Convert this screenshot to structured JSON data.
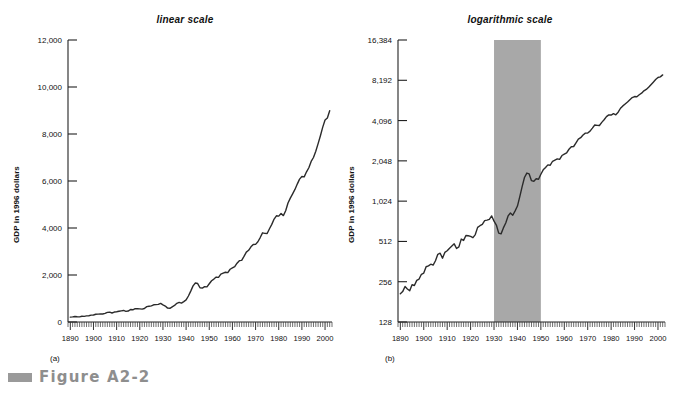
{
  "figure": {
    "caption": "Figure A2-2",
    "swatch_color": "#9a9a9a",
    "caption_color": "#8e8e8e"
  },
  "panels": [
    {
      "id": "linear",
      "title": "linear scale",
      "sub_label": "(a)",
      "y_axis_title": "GDP in 1996 dollars"
    },
    {
      "id": "log",
      "title": "logarithmic scale",
      "sub_label": "(b)",
      "y_axis_title": "GDP in 1996 dollars"
    }
  ],
  "chart_data": [
    {
      "type": "line",
      "id": "linear",
      "title": "linear scale",
      "xlabel": "",
      "ylabel": "GDP in 1996 dollars",
      "yscale": "linear",
      "ylim": [
        0,
        12000
      ],
      "xlim": [
        1889,
        2003
      ],
      "yticks": [
        0,
        2000,
        4000,
        6000,
        8000,
        10000,
        12000
      ],
      "ytick_labels": [
        "0",
        "2,000",
        "4,000",
        "6,000",
        "8,000",
        "10,000",
        "12,000"
      ],
      "xticks": [
        1890,
        1900,
        1910,
        1920,
        1930,
        1940,
        1950,
        1960,
        1970,
        1980,
        1990,
        2000
      ],
      "xtick_labels": [
        "1890",
        "1900",
        "1910",
        "1920",
        "1930",
        "1940",
        "1950",
        "1960",
        "1970",
        "1980",
        "1990",
        "2000"
      ],
      "minor_xtick_interval": 1,
      "grid": false,
      "legend": "none",
      "line_color": "#2b2b2b",
      "x": [
        1890,
        1891,
        1892,
        1893,
        1894,
        1895,
        1896,
        1897,
        1898,
        1899,
        1900,
        1901,
        1902,
        1903,
        1904,
        1905,
        1906,
        1907,
        1908,
        1909,
        1910,
        1911,
        1912,
        1913,
        1914,
        1915,
        1916,
        1917,
        1918,
        1919,
        1920,
        1921,
        1922,
        1923,
        1924,
        1925,
        1926,
        1927,
        1928,
        1929,
        1930,
        1931,
        1932,
        1933,
        1934,
        1935,
        1936,
        1937,
        1938,
        1939,
        1940,
        1941,
        1942,
        1943,
        1944,
        1945,
        1946,
        1947,
        1948,
        1949,
        1950,
        1951,
        1952,
        1953,
        1954,
        1955,
        1956,
        1957,
        1958,
        1959,
        1960,
        1961,
        1962,
        1963,
        1964,
        1965,
        1966,
        1967,
        1968,
        1969,
        1970,
        1971,
        1972,
        1973,
        1974,
        1975,
        1976,
        1977,
        1978,
        1979,
        1980,
        1981,
        1982,
        1983,
        1984,
        1985,
        1986,
        1987,
        1988,
        1989,
        1990,
        1991,
        1992,
        1993,
        1994,
        1995,
        1996,
        1997,
        1998,
        1999,
        2000,
        2001,
        2002
      ],
      "y": [
        208,
        216,
        236,
        226,
        219,
        243,
        240,
        262,
        268,
        291,
        297,
        331,
        336,
        346,
        341,
        367,
        410,
        418,
        384,
        424,
        436,
        456,
        473,
        491,
        453,
        466,
        533,
        521,
        567,
        565,
        559,
        546,
        576,
        652,
        671,
        687,
        732,
        739,
        748,
        794,
        726,
        679,
        591,
        583,
        646,
        703,
        794,
        835,
        803,
        867,
        941,
        1107,
        1314,
        1538,
        1660,
        1636,
        1456,
        1443,
        1504,
        1494,
        1626,
        1755,
        1827,
        1912,
        1900,
        2034,
        2076,
        2117,
        2100,
        2245,
        2301,
        2353,
        2501,
        2610,
        2622,
        2791,
        2974,
        3050,
        3199,
        3300,
        3304,
        3414,
        3593,
        3795,
        3772,
        3765,
        3969,
        4153,
        4381,
        4519,
        4506,
        4618,
        4527,
        4732,
        5064,
        5273,
        5455,
        5642,
        5869,
        6081,
        6192,
        6177,
        6391,
        6565,
        6834,
        7000,
        7266,
        7592,
        7928,
        8291,
        8597,
        8684,
        8990
      ]
    },
    {
      "type": "line",
      "id": "log",
      "title": "logarithmic scale",
      "xlabel": "",
      "ylabel": "GDP in 1996 dollars",
      "yscale": "log2",
      "ylim": [
        128,
        16384
      ],
      "xlim": [
        1889,
        2003
      ],
      "yticks": [
        128,
        256,
        512,
        1024,
        2048,
        4096,
        8192,
        16384
      ],
      "ytick_labels": [
        "128",
        "256",
        "512",
        "1,024",
        "2,048",
        "4,096",
        "8,192",
        "16,384"
      ],
      "xticks": [
        1890,
        1900,
        1910,
        1920,
        1930,
        1940,
        1950,
        1960,
        1970,
        1980,
        1990,
        2000
      ],
      "xtick_labels": [
        "1890",
        "1900",
        "1910",
        "1920",
        "1930",
        "1940",
        "1950",
        "1960",
        "1970",
        "1980",
        "1990",
        "2000"
      ],
      "minor_xtick_interval": 1,
      "grid": false,
      "legend": "none",
      "line_color": "#2b2b2b",
      "shaded_region": {
        "x_start": 1930,
        "x_end": 1950,
        "color": "#a8a8a8",
        "label": "Great Depression and World War II"
      },
      "x": [
        1890,
        1891,
        1892,
        1893,
        1894,
        1895,
        1896,
        1897,
        1898,
        1899,
        1900,
        1901,
        1902,
        1903,
        1904,
        1905,
        1906,
        1907,
        1908,
        1909,
        1910,
        1911,
        1912,
        1913,
        1914,
        1915,
        1916,
        1917,
        1918,
        1919,
        1920,
        1921,
        1922,
        1923,
        1924,
        1925,
        1926,
        1927,
        1928,
        1929,
        1930,
        1931,
        1932,
        1933,
        1934,
        1935,
        1936,
        1937,
        1938,
        1939,
        1940,
        1941,
        1942,
        1943,
        1944,
        1945,
        1946,
        1947,
        1948,
        1949,
        1950,
        1951,
        1952,
        1953,
        1954,
        1955,
        1956,
        1957,
        1958,
        1959,
        1960,
        1961,
        1962,
        1963,
        1964,
        1965,
        1966,
        1967,
        1968,
        1969,
        1970,
        1971,
        1972,
        1973,
        1974,
        1975,
        1976,
        1977,
        1978,
        1979,
        1980,
        1981,
        1982,
        1983,
        1984,
        1985,
        1986,
        1987,
        1988,
        1989,
        1990,
        1991,
        1992,
        1993,
        1994,
        1995,
        1996,
        1997,
        1998,
        1999,
        2000,
        2001,
        2002
      ],
      "y": [
        208,
        216,
        236,
        226,
        219,
        243,
        240,
        262,
        268,
        291,
        297,
        331,
        336,
        346,
        341,
        367,
        410,
        418,
        384,
        424,
        436,
        456,
        473,
        491,
        453,
        466,
        533,
        521,
        567,
        565,
        559,
        546,
        576,
        652,
        671,
        687,
        732,
        739,
        748,
        794,
        726,
        679,
        591,
        583,
        646,
        703,
        794,
        835,
        803,
        867,
        941,
        1107,
        1314,
        1538,
        1660,
        1636,
        1456,
        1443,
        1504,
        1494,
        1626,
        1755,
        1827,
        1912,
        1900,
        2034,
        2076,
        2117,
        2100,
        2245,
        2301,
        2353,
        2501,
        2610,
        2622,
        2791,
        2974,
        3050,
        3199,
        3300,
        3304,
        3414,
        3593,
        3795,
        3772,
        3765,
        3969,
        4153,
        4381,
        4519,
        4506,
        4618,
        4527,
        4732,
        5064,
        5273,
        5455,
        5642,
        5869,
        6081,
        6192,
        6177,
        6391,
        6565,
        6834,
        7000,
        7266,
        7592,
        7928,
        8291,
        8597,
        8684,
        8990
      ]
    }
  ]
}
